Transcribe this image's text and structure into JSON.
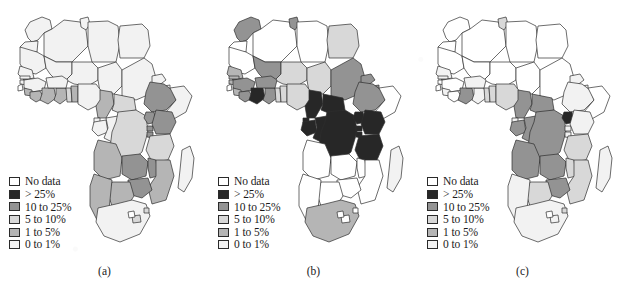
{
  "figure": {
    "background_color": "#ffffff",
    "border_color": "#2a2a2a"
  },
  "legend": {
    "classes": [
      {
        "key": "no_data",
        "label": "No data",
        "color": "#ffffff"
      },
      {
        "key": "gt25",
        "label": "> 25%",
        "color": "#272727"
      },
      {
        "key": "c10_25",
        "label": "10 to 25%",
        "color": "#939393"
      },
      {
        "key": "c5_10",
        "label": "5 to 10%",
        "color": "#d8d8d8"
      },
      {
        "key": "c1_5",
        "label": "1 to 5%",
        "color": "#b5b5b5"
      },
      {
        "key": "c0_1",
        "label": "0 to 1%",
        "color": "#f2f2f2"
      }
    ]
  },
  "panels": [
    {
      "id": "panel-a",
      "caption": "(a)",
      "countries": {
        "morocco": "c0_1",
        "western_sahara": "c0_1",
        "algeria": "c0_1",
        "tunisia": "c0_1",
        "libya": "c0_1",
        "egypt": "c0_1",
        "mauritania": "c0_1",
        "mali": "c0_1",
        "niger": "c0_1",
        "chad": "c0_1",
        "sudan": "c0_1",
        "eritrea": "c0_1",
        "djibouti": "c0_1",
        "ethiopia": "c10_25",
        "somalia": "c0_1",
        "senegal": "c0_1",
        "gambia": "c0_1",
        "guinea_bissau": "c0_1",
        "guinea": "c0_1",
        "sierra_leone": "c1_5",
        "liberia": "c1_5",
        "ivory_coast": "c1_5",
        "ghana": "c1_5",
        "togo": "c5_10",
        "benin": "c1_5",
        "burkina_faso": "c0_1",
        "nigeria": "c0_1",
        "cameroon": "c1_5",
        "car": "c5_10",
        "equatorial_guinea": "c0_1",
        "gabon": "c0_1",
        "congo": "c0_1",
        "drc": "c5_10",
        "uganda": "c10_25",
        "rwanda": "c10_25",
        "burundi": "c10_25",
        "kenya": "c10_25",
        "tanzania": "c5_10",
        "angola": "c1_5",
        "zambia": "c10_25",
        "malawi": "c10_25",
        "mozambique": "c1_5",
        "zimbabwe": "c10_25",
        "botswana": "c1_5",
        "namibia": "c1_5",
        "south_africa": "c0_1",
        "lesotho": "c5_10",
        "swaziland": "c5_10",
        "madagascar": "c0_1"
      }
    },
    {
      "id": "panel-b",
      "caption": "(b)",
      "countries": {
        "morocco": "c10_25",
        "western_sahara": "no_data",
        "algeria": "no_data",
        "tunisia": "c10_25",
        "libya": "no_data",
        "egypt": "c5_10",
        "mauritania": "no_data",
        "mali": "c10_25",
        "niger": "c5_10",
        "chad": "c5_10",
        "sudan": "c10_25",
        "eritrea": "c10_25",
        "djibouti": "c10_25",
        "ethiopia": "c10_25",
        "somalia": "no_data",
        "senegal": "c1_5",
        "gambia": "c1_5",
        "guinea_bissau": "c1_5",
        "guinea": "c10_25",
        "sierra_leone": "c1_5",
        "liberia": "c10_25",
        "ivory_coast": "gt25",
        "ghana": "c10_25",
        "togo": "c5_10",
        "benin": "c5_10",
        "burkina_faso": "c10_25",
        "nigeria": "c5_10",
        "cameroon": "gt25",
        "car": "gt25",
        "equatorial_guinea": "gt25",
        "gabon": "gt25",
        "congo": "gt25",
        "drc": "gt25",
        "uganda": "gt25",
        "rwanda": "gt25",
        "burundi": "gt25",
        "kenya": "gt25",
        "tanzania": "gt25",
        "angola": "no_data",
        "zambia": "no_data",
        "malawi": "no_data",
        "mozambique": "no_data",
        "zimbabwe": "no_data",
        "botswana": "no_data",
        "namibia": "no_data",
        "south_africa": "c1_5",
        "lesotho": "no_data",
        "swaziland": "no_data",
        "madagascar": "c0_1"
      }
    },
    {
      "id": "panel-c",
      "caption": "(c)",
      "countries": {
        "morocco": "no_data",
        "western_sahara": "no_data",
        "algeria": "no_data",
        "tunisia": "c5_10",
        "libya": "no_data",
        "egypt": "no_data",
        "mauritania": "no_data",
        "mali": "no_data",
        "niger": "no_data",
        "chad": "no_data",
        "sudan": "no_data",
        "eritrea": "c0_1",
        "djibouti": "c0_1",
        "ethiopia": "c0_1",
        "somalia": "no_data",
        "senegal": "c0_1",
        "gambia": "c0_1",
        "guinea_bissau": "no_data",
        "guinea": "no_data",
        "sierra_leone": "c0_1",
        "liberia": "no_data",
        "ivory_coast": "c10_25",
        "ghana": "c0_1",
        "togo": "c5_10",
        "benin": "c5_10",
        "burkina_faso": "c0_1",
        "nigeria": "c5_10",
        "cameroon": "c10_25",
        "car": "c10_25",
        "equatorial_guinea": "c0_1",
        "gabon": "c10_25",
        "congo": "c10_25",
        "drc": "c10_25",
        "uganda": "gt25",
        "rwanda": "c0_1",
        "burundi": "c0_1",
        "kenya": "c0_1",
        "tanzania": "c5_10",
        "angola": "c10_25",
        "zambia": "c10_25",
        "malawi": "c5_10",
        "mozambique": "c5_10",
        "zimbabwe": "c10_25",
        "botswana": "c5_10",
        "namibia": "c0_1",
        "south_africa": "c0_1",
        "lesotho": "c0_1",
        "swaziland": "c5_10",
        "madagascar": "c0_1"
      }
    }
  ]
}
